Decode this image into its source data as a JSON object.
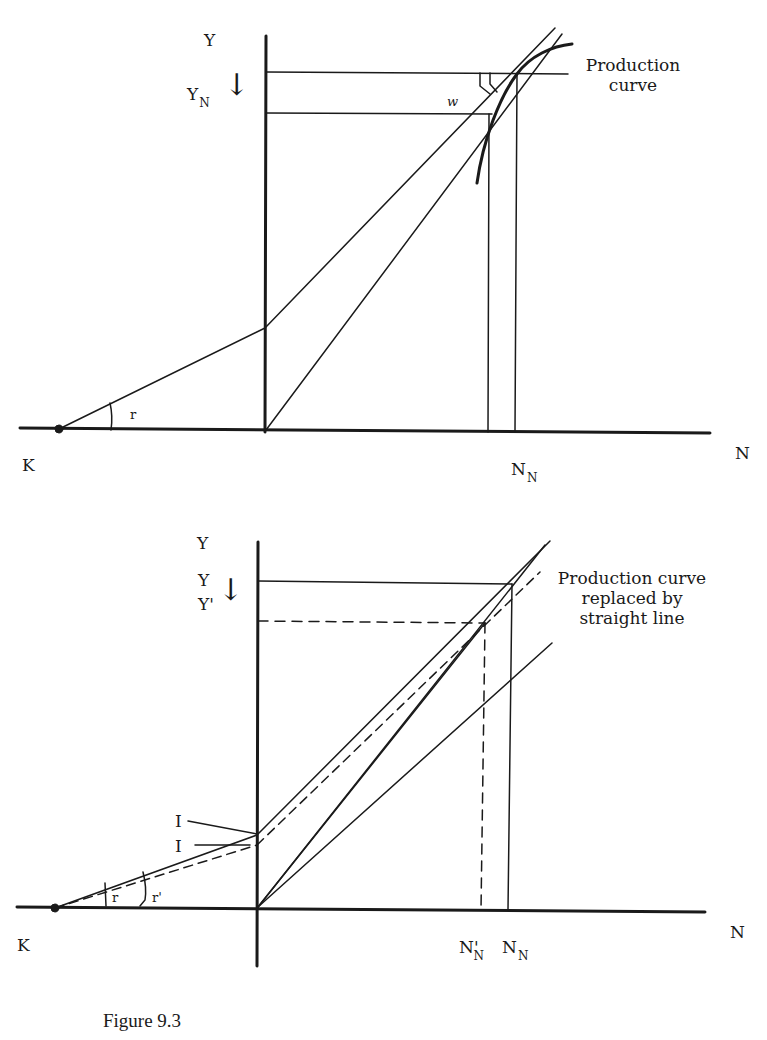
{
  "figure": {
    "caption": "Figure 9.3",
    "top_panel": {
      "y_axis_label": "Y",
      "yn_label": "Y",
      "yn_sub": "N",
      "arrow": "↓",
      "w_label": "w",
      "r_label": "r",
      "k_label": "K",
      "n_axis_label": "N",
      "nn_label": "N",
      "nn_sub": "N",
      "curve_note_line1": "Production",
      "curve_note_line2": "curve"
    },
    "bottom_panel": {
      "y_axis_label": "Y",
      "y_label": "Y",
      "y_prime_label": "Y'",
      "arrow": "↓",
      "i_label_1": "I",
      "i_label_2": "I",
      "r_label": "r",
      "r_prime_label": "r'",
      "k_label": "K",
      "n_axis_label": "N",
      "nn_prime_label": "N'",
      "nn_prime_sub": "N",
      "nn_label": "N",
      "nn_sub": "N",
      "curve_note_line1": "Production curve",
      "curve_note_line2": "replaced by",
      "curve_note_line3": "straight line"
    }
  }
}
